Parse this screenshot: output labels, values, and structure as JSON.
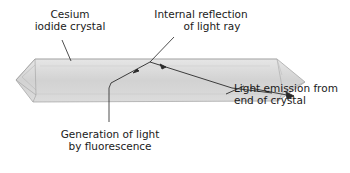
{
  "diagram": {
    "labels": {
      "crystal": [
        "Cesium",
        "iodide crystal"
      ],
      "reflection": [
        "Internal reflection",
        "of light ray"
      ],
      "emission": [
        "Light emission from",
        "end of crystal"
      ],
      "generation": [
        "Generation of light",
        "by fluorescence"
      ]
    },
    "colors": {
      "crystal_fill": "#d9d9d9",
      "crystal_edge": "#a8a8a8",
      "ray": "#2a2a2a",
      "leader": "#222222"
    }
  }
}
